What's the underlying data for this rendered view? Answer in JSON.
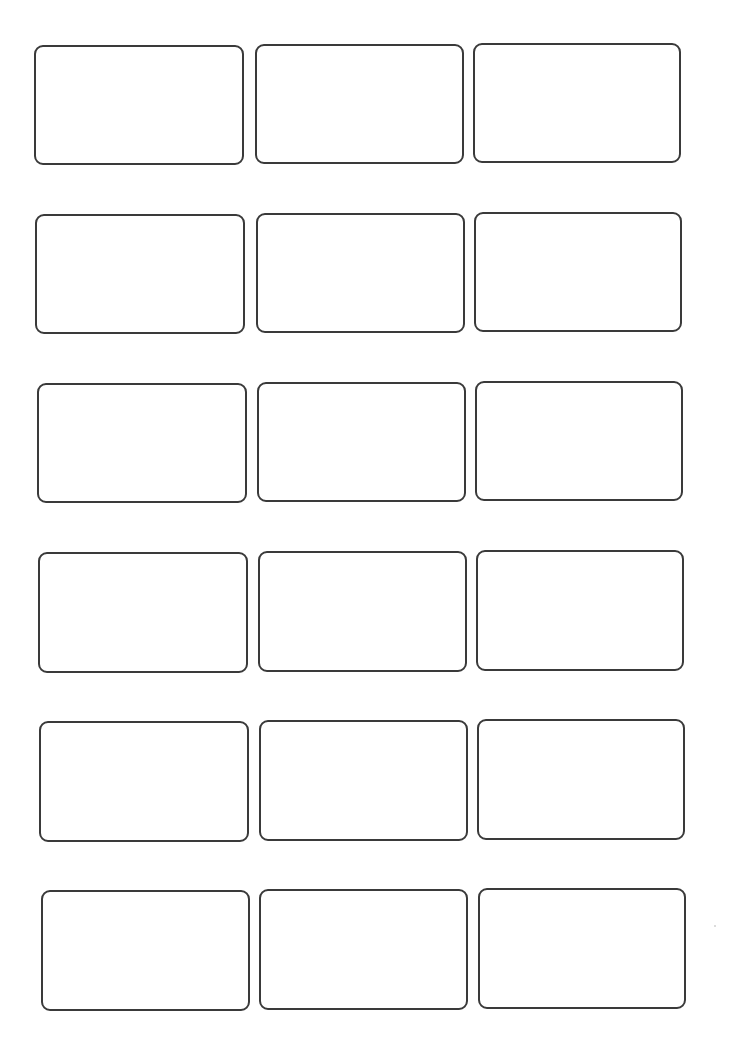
{
  "sheet": {
    "type": "label-template",
    "rows": 6,
    "columns": 3,
    "border_color": "#3a3a3a",
    "background": "#ffffff",
    "labels": [
      {
        "row": 1,
        "col": 1,
        "x": 34,
        "y": 45,
        "w": 210,
        "h": 120
      },
      {
        "row": 1,
        "col": 2,
        "x": 255,
        "y": 44,
        "w": 209,
        "h": 120
      },
      {
        "row": 1,
        "col": 3,
        "x": 473,
        "y": 43,
        "w": 208,
        "h": 120
      },
      {
        "row": 2,
        "col": 1,
        "x": 35,
        "y": 214,
        "w": 210,
        "h": 120
      },
      {
        "row": 2,
        "col": 2,
        "x": 256,
        "y": 213,
        "w": 209,
        "h": 120
      },
      {
        "row": 2,
        "col": 3,
        "x": 474,
        "y": 212,
        "w": 208,
        "h": 120
      },
      {
        "row": 3,
        "col": 1,
        "x": 37,
        "y": 383,
        "w": 210,
        "h": 120
      },
      {
        "row": 3,
        "col": 2,
        "x": 257,
        "y": 382,
        "w": 209,
        "h": 120
      },
      {
        "row": 3,
        "col": 3,
        "x": 475,
        "y": 381,
        "w": 208,
        "h": 120
      },
      {
        "row": 4,
        "col": 1,
        "x": 38,
        "y": 552,
        "w": 210,
        "h": 121
      },
      {
        "row": 4,
        "col": 2,
        "x": 258,
        "y": 551,
        "w": 209,
        "h": 121
      },
      {
        "row": 4,
        "col": 3,
        "x": 476,
        "y": 550,
        "w": 208,
        "h": 121
      },
      {
        "row": 5,
        "col": 1,
        "x": 39,
        "y": 721,
        "w": 210,
        "h": 121
      },
      {
        "row": 5,
        "col": 2,
        "x": 259,
        "y": 720,
        "w": 209,
        "h": 121
      },
      {
        "row": 5,
        "col": 3,
        "x": 477,
        "y": 719,
        "w": 208,
        "h": 121
      },
      {
        "row": 6,
        "col": 1,
        "x": 41,
        "y": 890,
        "w": 209,
        "h": 121
      },
      {
        "row": 6,
        "col": 2,
        "x": 259,
        "y": 889,
        "w": 209,
        "h": 121
      },
      {
        "row": 6,
        "col": 3,
        "x": 478,
        "y": 888,
        "w": 208,
        "h": 121
      }
    ]
  }
}
